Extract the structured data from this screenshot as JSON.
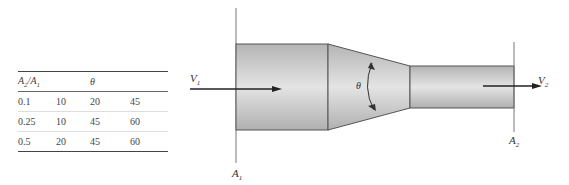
{
  "table": {
    "headers": [
      "A2/A1",
      "",
      "θ",
      ""
    ],
    "header_a_main": "A",
    "header_a_sub1": "2",
    "header_slash": "/A",
    "header_a_sub2": "1",
    "header_theta": "θ",
    "rows": [
      [
        "0.1",
        "10",
        "20",
        "45"
      ],
      [
        "0.25",
        "10",
        "45",
        "60"
      ],
      [
        "0.5",
        "20",
        "45",
        "60"
      ]
    ]
  },
  "diagram": {
    "v1_main": "V",
    "v1_sub": "1",
    "v2_main": "V",
    "v2_sub": "2",
    "a1_main": "A",
    "a1_sub": "1",
    "a2_main": "A",
    "a2_sub": "2",
    "theta": "θ",
    "pipe_color": "#c8c8c8",
    "outline_color": "#555555"
  }
}
